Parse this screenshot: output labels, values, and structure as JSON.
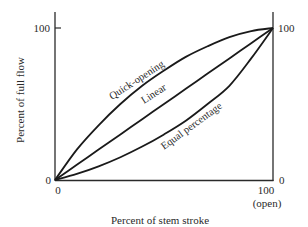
{
  "chart_data": {
    "type": "line",
    "title": "",
    "xlabel": "Percent of stem stroke",
    "ylabel": "Percent of full flow",
    "xlim": [
      0,
      100
    ],
    "ylim": [
      0,
      100
    ],
    "grid": false,
    "legend": "inline curve labels",
    "x_ticks": [
      {
        "value": 0,
        "label": "0"
      },
      {
        "value": 100,
        "label": "100",
        "sublabel": "(open)"
      }
    ],
    "y_ticks_left": [
      {
        "value": 0,
        "label": "0"
      },
      {
        "value": 100,
        "label": "100"
      }
    ],
    "y_ticks_right": [
      {
        "value": 0,
        "label": "0"
      },
      {
        "value": 100,
        "label": "100"
      }
    ],
    "x": [
      0,
      10,
      20,
      30,
      40,
      50,
      60,
      70,
      80,
      90,
      100
    ],
    "series": [
      {
        "name": "Quick-opening",
        "label": "Quick-opening",
        "values": [
          0,
          20,
          36,
          50,
          62,
          72,
          81,
          88,
          94,
          98,
          100
        ]
      },
      {
        "name": "Linear",
        "label": "Linear",
        "values": [
          0,
          10,
          20,
          30,
          40,
          50,
          60,
          70,
          80,
          90,
          100
        ]
      },
      {
        "name": "Equal percentage",
        "label": "Equal percentage",
        "values": [
          0,
          4,
          9,
          15,
          22,
          30,
          39,
          50,
          62,
          80,
          100
        ]
      }
    ],
    "color": "#1a1a1a"
  }
}
